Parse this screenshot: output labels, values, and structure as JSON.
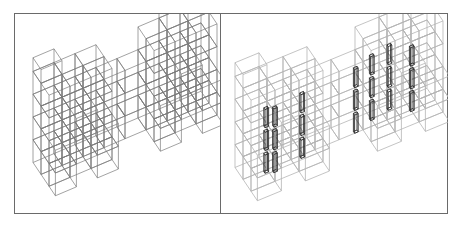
{
  "figure": {
    "panels": [
      {
        "id": "left",
        "description": "isometric wireframe of modular building frame structure",
        "stroke": "#7a7a7a",
        "accent_stroke": "#555555"
      },
      {
        "id": "right",
        "description": "isometric wireframe of modular building frame with highlighted vertical elements",
        "stroke": "#b5b5b5",
        "accent_stroke": "#2a2a2a"
      }
    ],
    "border_color": "#6a6a6a",
    "background": "#ffffff"
  }
}
